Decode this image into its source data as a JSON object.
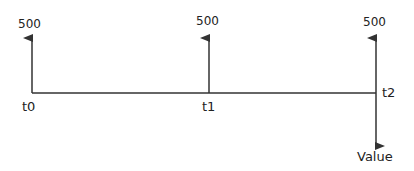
{
  "diagram": {
    "type": "cash-flow-timeline",
    "timeline_color": "#333333",
    "points": [
      {
        "time_label": "t0",
        "amount": "500",
        "direction": "up"
      },
      {
        "time_label": "t1",
        "amount": "500",
        "direction": "up"
      },
      {
        "time_label": "t2",
        "amount": "500",
        "direction": "up"
      }
    ],
    "outflow": {
      "label": "Value",
      "at": "t2",
      "direction": "down"
    }
  }
}
